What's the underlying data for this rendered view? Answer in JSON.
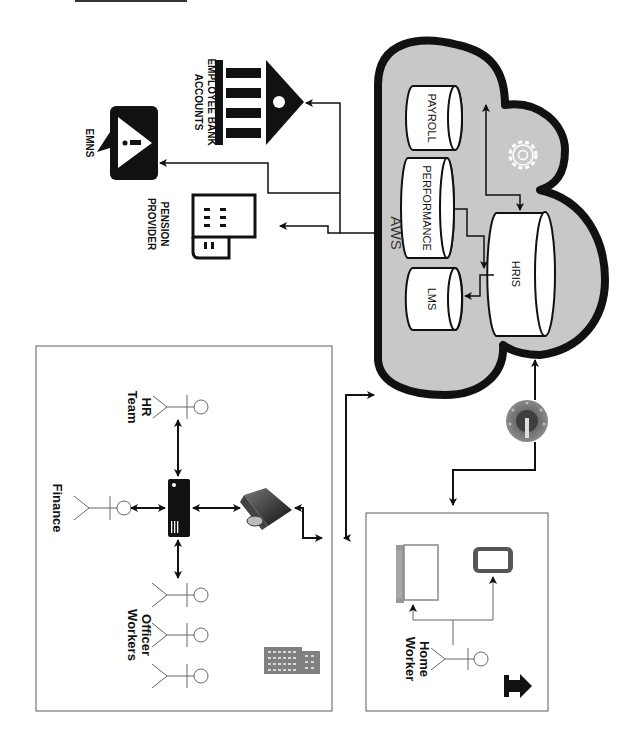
{
  "diagram": {
    "orientation": "rotated-90-clockwise",
    "colors": {
      "cloud_fill": "#c8c8c8",
      "cloud_stroke": "#111111",
      "line": "#111111",
      "building_icon": "#808080",
      "db_fill": "#ffffff",
      "box_border": "#777777"
    },
    "cloud": {
      "label": "AWS",
      "databases": [
        {
          "id": "payroll",
          "label": "PAYROLL"
        },
        {
          "id": "performance",
          "label": "PERFORMANCE"
        },
        {
          "id": "lms",
          "label": "LMS"
        },
        {
          "id": "hris",
          "label": "HRIS"
        }
      ],
      "gear_icon": "gear-icon"
    },
    "external": {
      "bank": {
        "label_line1": "EMPLOYEE BANK",
        "label_line2": "ACCOUNTS",
        "icon": "bank-icon"
      },
      "emns": {
        "label": "EMNS",
        "icon": "alert-icon"
      },
      "pension": {
        "label_line1": "PENSION",
        "label_line2": "PROVIDER",
        "icon": "office-building-icon"
      }
    },
    "office": {
      "actors": [
        {
          "id": "hr",
          "label_line1": "HR",
          "label_line2": "Team"
        },
        {
          "id": "finance",
          "label": "Finance"
        },
        {
          "id": "officer",
          "label_line1": "Officer",
          "label_line2": "Workers"
        }
      ],
      "server_icon": "server-icon",
      "firewall_icon": "firewall-router-icon",
      "building_icon": "office-building-icon"
    },
    "home": {
      "actor": {
        "label_line1": "Home",
        "label_line2": "Worker"
      },
      "devices": [
        "laptop-icon",
        "smartphone-icon"
      ],
      "home_icon": "home-icon"
    },
    "vpn": {
      "icon": "vpn-gateway-icon"
    }
  }
}
